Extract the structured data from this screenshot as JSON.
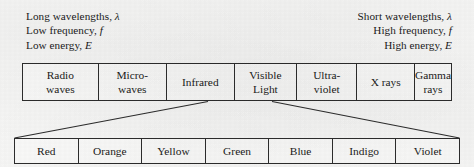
{
  "captions": {
    "left": [
      {
        "text": "Long wavelengths, ",
        "symbol": "λ"
      },
      {
        "text": "Low frequency, ",
        "symbol": "f"
      },
      {
        "text": "Low energy, ",
        "symbol": "E"
      }
    ],
    "right": [
      {
        "text": "Short wavelengths, ",
        "symbol": "λ"
      },
      {
        "text": "High frequency, ",
        "symbol": "f"
      },
      {
        "text": "High energy, ",
        "symbol": "E"
      }
    ],
    "left_line_1_text": "Long wavelengths,",
    "left_line_1_sym": "λ",
    "left_line_2_text": "Low frequency,",
    "left_line_2_sym": "f",
    "left_line_3_text": "Low energy,",
    "left_line_3_sym": "E",
    "right_line_1_text": "Short wavelengths,",
    "right_line_1_sym": "λ",
    "right_line_2_text": "High frequency,",
    "right_line_2_sym": "f",
    "right_line_3_text": "High energy,",
    "right_line_3_sym": "E"
  },
  "spectrum": {
    "bands": [
      {
        "line1": "Radio",
        "line2": "waves",
        "width_px": 78
      },
      {
        "line1": "Micro-",
        "line2": "waves",
        "width_px": 70
      },
      {
        "line1": "Infrared",
        "line2": "",
        "width_px": 70
      },
      {
        "line1": "Visible",
        "line2": "Light",
        "width_px": 64
      },
      {
        "line1": "Ultra-",
        "line2": "violet",
        "width_px": 62
      },
      {
        "line1": "X rays",
        "line2": "",
        "width_px": 59
      },
      {
        "line1": "Gamma",
        "line2": "rays",
        "width_px": 27
      }
    ]
  },
  "visible_light": {
    "colors": [
      "Red",
      "Orange",
      "Yellow",
      "Green",
      "Blue",
      "Indigo",
      "Violet"
    ]
  },
  "style": {
    "ink": "#2c2c2c",
    "paper": "#f7f7f6"
  }
}
